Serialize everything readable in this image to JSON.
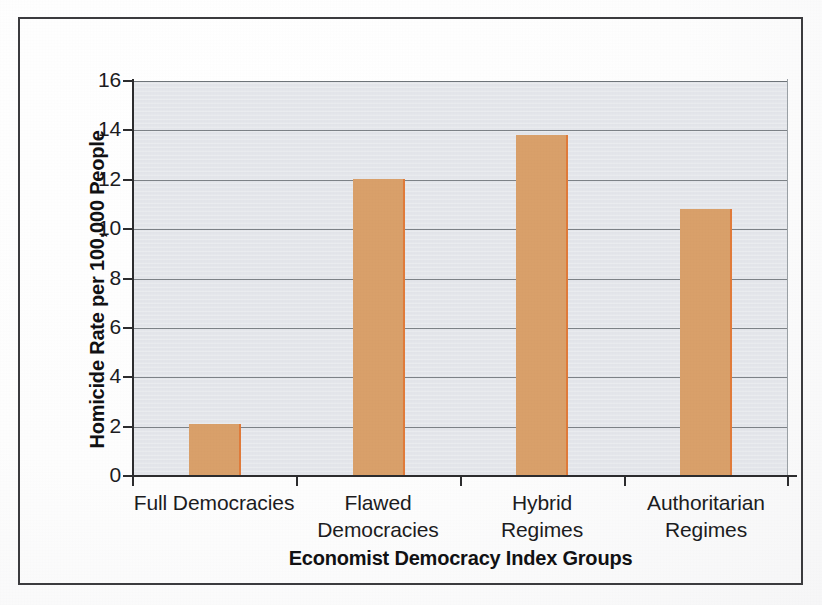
{
  "chart_data": {
    "type": "bar",
    "title": "",
    "subtitle": "",
    "xlabel": "Economist Democracy Index Groups",
    "ylabel": "Homicide Rate per 100,000 People",
    "categories": [
      "Full Democracies",
      "Flawed Democracies",
      "Hybrid Regimes",
      "Authoritarian Regimes"
    ],
    "category_lines": [
      [
        "Full Democracies"
      ],
      [
        "Flawed",
        "Democracies"
      ],
      [
        "Hybrid",
        "Regimes"
      ],
      [
        "Authoritarian",
        "Regimes"
      ]
    ],
    "values": [
      2.1,
      12.05,
      13.8,
      10.8
    ],
    "ylim": [
      0,
      16
    ],
    "ytick_values": [
      0,
      2,
      4,
      6,
      8,
      10,
      12,
      14,
      16
    ],
    "ytick_labels": [
      "0",
      "2",
      "4",
      "6",
      "8",
      "10",
      "12",
      "14",
      "16"
    ],
    "grid": true,
    "grid_axis": "y",
    "legend": false,
    "legend_position": "none",
    "bar_color": "#d9a06a",
    "bar_edge_color": "#e07b3a",
    "plot_background_color": "#e3e5ea",
    "axis_color": "#2c2c2e",
    "gridline_color": "#7d8287",
    "text_color": "#1c1c1e",
    "frame_color": "#3b3b3e",
    "page_background_color": "#ffffff"
  }
}
